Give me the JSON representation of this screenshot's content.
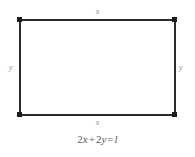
{
  "figure": {
    "type": "geometry-diagram",
    "shape": "rectangle",
    "colors": {
      "background": "#ffffff",
      "edge": "#2b2b2b",
      "vertex": "#1c1c1c",
      "side_label": "#8e8e8e",
      "equation": "#5c5c5c"
    },
    "labels": {
      "top": "x",
      "bottom": "x",
      "left": "y",
      "right": "y"
    },
    "vertices": {
      "top_left": "top-left-vertex",
      "top_right": "top-right-vertex",
      "bottom_left": "bottom-left-vertex",
      "bottom_right": "bottom-right-vertex"
    },
    "equation": {
      "full": "2x + 2y = l",
      "coefficient_x": "2",
      "var_x": "x",
      "plus": "+",
      "coefficient_y": "2",
      "var_y": "y",
      "equals": "=",
      "result": "l"
    }
  }
}
